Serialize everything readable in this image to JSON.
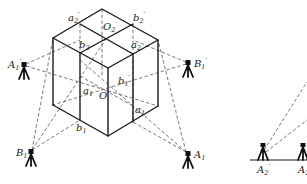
{
  "figure": {
    "labels": {
      "a2p": {
        "main": "a",
        "sub": "2",
        "prime": "′"
      },
      "b2p": {
        "main": "b",
        "sub": "2",
        "prime": "′"
      },
      "O2": {
        "main": "O",
        "sub": "2",
        "prime": ""
      },
      "b2": {
        "main": "b",
        "sub": "2",
        "prime": ""
      },
      "a2": {
        "main": "a",
        "sub": "2",
        "prime": ""
      },
      "b1p": {
        "main": "b",
        "sub": "1",
        "prime": "′"
      },
      "a1p": {
        "main": "a",
        "sub": "1",
        "prime": "′"
      },
      "O": {
        "main": "O",
        "sub": "",
        "prime": ""
      },
      "b1": {
        "main": "b",
        "sub": "1",
        "prime": ""
      },
      "a1": {
        "main": "a",
        "sub": "1",
        "prime": ""
      },
      "A1p": {
        "main": "A",
        "sub": "1",
        "prime": "′"
      },
      "B1p": {
        "main": "B",
        "sub": "1",
        "prime": "′"
      },
      "B1": {
        "main": "B",
        "sub": "1",
        "prime": ""
      },
      "A1": {
        "main": "A",
        "sub": "1",
        "prime": ""
      },
      "A2p": {
        "main": "A",
        "sub": "2",
        "prime": "′"
      },
      "A2": {
        "main": "A",
        "sub": "2",
        "prime": ""
      }
    },
    "stations": [
      "A1p",
      "B1p",
      "B1",
      "A1",
      "A2p",
      "A2"
    ]
  }
}
